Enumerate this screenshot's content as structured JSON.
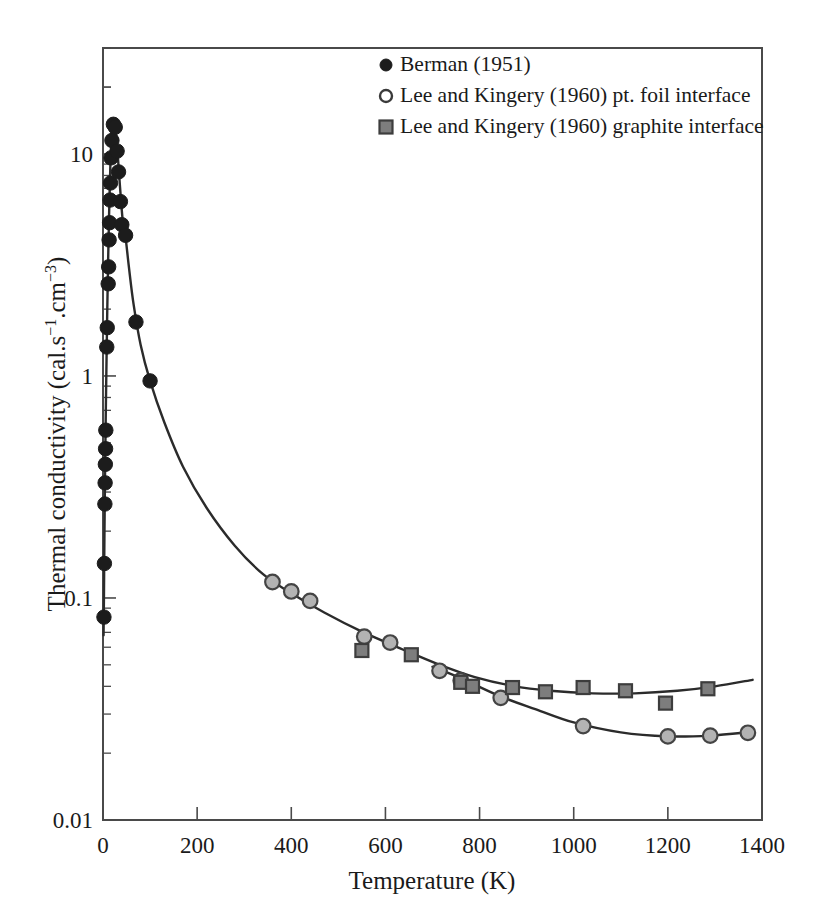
{
  "chart_data": {
    "type": "scatter",
    "title": "",
    "xlabel": "Temperature (K)",
    "ylabel": "Thermal conductivity (cal.s⁻¹.cm⁻³)",
    "ylabel_plain": "Thermal conductivity (cal.s-1.cm-3)",
    "xlim": [
      0,
      1400
    ],
    "ylim": [
      0.01,
      30
    ],
    "yscale": "log",
    "xscale": "linear",
    "grid": false,
    "legend_position": "top-center",
    "xticks": [
      0,
      200,
      400,
      600,
      800,
      1000,
      1200,
      1400
    ],
    "xtick_labels": [
      "0",
      "200",
      "400",
      "600",
      "800",
      "1000",
      "1200",
      "1400"
    ],
    "yticks": [
      0.01,
      0.1,
      1,
      10
    ],
    "ytick_labels": [
      "0.01",
      "0.1",
      "1",
      "10"
    ],
    "series": [
      {
        "name": "Berman (1951)",
        "marker": "filled-circle",
        "color": "#1c1c1c",
        "edge_color": "#1c1c1c",
        "points": [
          [
            2,
            0.082
          ],
          [
            3,
            0.143
          ],
          [
            4,
            0.265
          ],
          [
            4.5,
            0.33
          ],
          [
            5,
            0.4
          ],
          [
            5.5,
            0.47
          ],
          [
            6,
            0.57
          ],
          [
            8,
            1.35
          ],
          [
            9,
            1.65
          ],
          [
            11,
            2.6
          ],
          [
            12,
            3.1
          ],
          [
            13,
            4.1
          ],
          [
            14,
            4.9
          ],
          [
            15,
            6.2
          ],
          [
            16,
            7.4
          ],
          [
            17,
            9.6
          ],
          [
            19,
            11.5
          ],
          [
            22,
            13.6
          ],
          [
            26,
            13.2
          ],
          [
            30,
            10.3
          ],
          [
            33,
            8.3
          ],
          [
            37,
            6.1
          ],
          [
            40,
            4.8
          ],
          [
            48,
            4.3
          ],
          [
            70,
            1.75
          ],
          [
            100,
            0.95
          ]
        ]
      },
      {
        "name": "Lee and Kingery (1960) pt. foil interface",
        "marker": "open-circle",
        "color": "#b3b3b3",
        "edge_color": "#444444",
        "points": [
          [
            360,
            0.118
          ],
          [
            400,
            0.107
          ],
          [
            440,
            0.097
          ],
          [
            555,
            0.067
          ],
          [
            610,
            0.063
          ],
          [
            715,
            0.047
          ],
          [
            760,
            0.0425
          ],
          [
            845,
            0.0355
          ],
          [
            1020,
            0.0265
          ],
          [
            1200,
            0.0238
          ],
          [
            1290,
            0.024
          ],
          [
            1370,
            0.0247
          ]
        ]
      },
      {
        "name": "Lee and Kingery (1960) graphite interface",
        "marker": "filled-square",
        "color": "#7d7d7d",
        "edge_color": "#3d3d3d",
        "points": [
          [
            550,
            0.058
          ],
          [
            655,
            0.0555
          ],
          [
            760,
            0.0417
          ],
          [
            785,
            0.04
          ],
          [
            870,
            0.0395
          ],
          [
            940,
            0.0378
          ],
          [
            1020,
            0.0395
          ],
          [
            1110,
            0.0382
          ],
          [
            1195,
            0.0336
          ],
          [
            1285,
            0.039
          ]
        ]
      }
    ],
    "curves": [
      {
        "name": "main-curve",
        "description": "Berman low temperature peak decaying into high temperature tail, ending on graphite interface branch",
        "points": [
          [
            1.2,
            0.068
          ],
          [
            2,
            0.1
          ],
          [
            3,
            0.185
          ],
          [
            4,
            0.31
          ],
          [
            5,
            0.47
          ],
          [
            6,
            0.7
          ],
          [
            7,
            1.0
          ],
          [
            8,
            1.4
          ],
          [
            9,
            1.95
          ],
          [
            10,
            2.6
          ],
          [
            11,
            3.4
          ],
          [
            12,
            4.3
          ],
          [
            13,
            5.4
          ],
          [
            14,
            6.6
          ],
          [
            15,
            7.9
          ],
          [
            16,
            9.3
          ],
          [
            18,
            11.4
          ],
          [
            20,
            12.9
          ],
          [
            22,
            13.6
          ],
          [
            24,
            13.7
          ],
          [
            26,
            13.2
          ],
          [
            28,
            12.2
          ],
          [
            31,
            10.2
          ],
          [
            34,
            8.2
          ],
          [
            38,
            6.3
          ],
          [
            42,
            5.0
          ],
          [
            48,
            4.2
          ],
          [
            55,
            3.1
          ],
          [
            65,
            2.1
          ],
          [
            80,
            1.38
          ],
          [
            100,
            0.95
          ],
          [
            130,
            0.62
          ],
          [
            170,
            0.39
          ],
          [
            220,
            0.255
          ],
          [
            280,
            0.172
          ],
          [
            340,
            0.128
          ],
          [
            400,
            0.105
          ],
          [
            470,
            0.086
          ],
          [
            550,
            0.0705
          ],
          [
            630,
            0.0595
          ],
          [
            710,
            0.0505
          ],
          [
            790,
            0.044
          ],
          [
            870,
            0.0402
          ],
          [
            950,
            0.0382
          ],
          [
            1040,
            0.0372
          ],
          [
            1130,
            0.0372
          ],
          [
            1220,
            0.0382
          ],
          [
            1300,
            0.04
          ],
          [
            1380,
            0.0428
          ]
        ]
      },
      {
        "name": "pt-foil-branch",
        "description": "lower high temperature branch through open circles",
        "points": [
          [
            700,
            0.049
          ],
          [
            760,
            0.0435
          ],
          [
            845,
            0.036
          ],
          [
            920,
            0.0315
          ],
          [
            1000,
            0.0275
          ],
          [
            1100,
            0.0248
          ],
          [
            1200,
            0.0238
          ],
          [
            1290,
            0.024
          ],
          [
            1375,
            0.0249
          ]
        ]
      }
    ],
    "legend": [
      {
        "marker": "filled-circle",
        "label": "Berman (1951)"
      },
      {
        "marker": "open-circle",
        "label": "Lee and Kingery (1960) pt. foil interface"
      },
      {
        "marker": "filled-square",
        "label": "Lee and Kingery (1960) graphite interface"
      }
    ],
    "colors": {
      "berman_marker": "#1c1c1c",
      "open_circle_fill": "#b3b3b3",
      "open_circle_edge": "#444444",
      "square_fill": "#7d7d7d",
      "square_edge": "#3d3d3d",
      "curve": "#2b2b2b",
      "axis": "#4a4a4a",
      "background": "#ffffff"
    }
  }
}
